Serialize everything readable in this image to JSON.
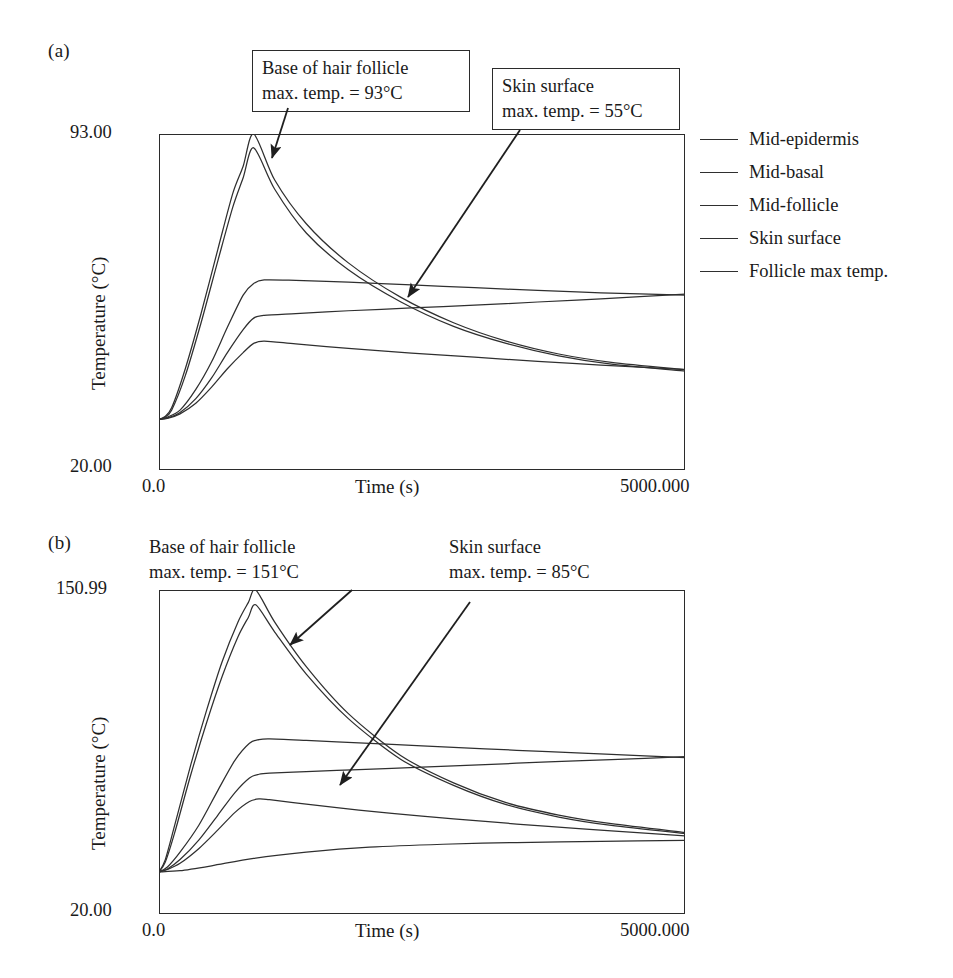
{
  "figure": {
    "panels": [
      {
        "id": "a",
        "label": "(a)",
        "callouts": [
          {
            "name": "follicle",
            "text": "Base of hair follicle\nmax. temp. = 93°C",
            "boxed": true
          },
          {
            "name": "skin",
            "text": "Skin surface\nmax. temp. = 55°C",
            "boxed": true
          }
        ],
        "axes": {
          "y_top_label": "93.00",
          "y_bottom_label": "20.00",
          "x_left_label": "0.0",
          "x_right_label": "5000.000",
          "x_title": "Time (s)",
          "y_title": "Temperature (°C)"
        },
        "legend": [
          {
            "label": "Mid-epidermis",
            "color": "#2f2f2f"
          },
          {
            "label": "Mid-basal",
            "color": "#2f2f2f"
          },
          {
            "label": "Mid-follicle",
            "color": "#2f2f2f"
          },
          {
            "label": "Skin surface",
            "color": "#2f2f2f"
          },
          {
            "label": "Follicle max temp.",
            "color": "#2f2f2f"
          }
        ]
      },
      {
        "id": "b",
        "label": "(b)",
        "callouts": [
          {
            "name": "follicle",
            "text": "Base of hair follicle\nmax. temp. = 151°C",
            "boxed": false
          },
          {
            "name": "skin",
            "text": "Skin surface\nmax. temp. = 85°C",
            "boxed": false
          }
        ],
        "axes": {
          "y_top_label": "150.99",
          "y_bottom_label": "20.00",
          "x_left_label": "0.0",
          "x_right_label": "5000.000",
          "x_title": "Time (s)",
          "y_title": "Temperature (°C)"
        },
        "legend": [
          {
            "label": "Mid-epidermis",
            "color": "#2f2f2f"
          },
          {
            "label": "Mid-basal",
            "color": "#2f2f2f"
          },
          {
            "label": "Mid-follicle",
            "color": "#2f2f2f"
          },
          {
            "label": "Skin surface",
            "color": "#2f2f2f"
          },
          {
            "label": "Follicle max temp.",
            "color": "#2f2f2f"
          }
        ]
      }
    ]
  },
  "chart_data": [
    {
      "panel": "a",
      "type": "line",
      "title": "(a)",
      "xlabel": "Time (s)",
      "ylabel": "Temperature (°C)",
      "xlim": [
        0.0,
        5000.0
      ],
      "ylim": [
        20.0,
        93.0
      ],
      "xticks": [
        0.0,
        5000.0
      ],
      "xticklabels": [
        "0.0",
        "5000.000"
      ],
      "yticks": [
        20.0,
        93.0
      ],
      "yticklabels": [
        "20.00",
        "93.00"
      ],
      "grid": false,
      "legend_position": "right",
      "annotations": [
        {
          "text": "Base of hair follicle max. temp. = 93°C",
          "points_to_series": "Follicle max temp."
        },
        {
          "text": "Skin surface max. temp. = 55°C",
          "points_to_series": "Skin surface"
        }
      ],
      "series": [
        {
          "name": "Follicle max temp.",
          "x": [
            0,
            50,
            120,
            250,
            400,
            560,
            700,
            800,
            900,
            1100,
            1400,
            1800,
            2300,
            2800,
            3300,
            3800,
            4300,
            5000
          ],
          "values": [
            31.0,
            31.5,
            33.5,
            42.0,
            54.0,
            68.0,
            80.0,
            86.0,
            93.0,
            83.0,
            73.5,
            65.0,
            57.5,
            52.0,
            48.0,
            45.2,
            43.4,
            41.8
          ]
        },
        {
          "name": "Mid-follicle",
          "x": [
            0,
            50,
            120,
            250,
            400,
            560,
            700,
            800,
            900,
            1100,
            1400,
            1800,
            2300,
            2800,
            3300,
            3800,
            4300,
            5000
          ],
          "values": [
            31.0,
            31.4,
            33.0,
            40.5,
            52.0,
            65.5,
            77.0,
            83.5,
            90.0,
            81.0,
            71.5,
            63.5,
            56.5,
            51.2,
            47.5,
            44.8,
            43.0,
            41.5
          ]
        },
        {
          "name": "Mid-epidermis",
          "x": [
            0,
            80,
            200,
            350,
            500,
            650,
            800,
            900,
            1000,
            1300,
            1800,
            2400,
            3000,
            3600,
            4200,
            5000
          ],
          "values": [
            31.0,
            31.5,
            33.0,
            37.5,
            43.5,
            51.0,
            58.0,
            60.5,
            61.3,
            61.2,
            60.8,
            60.2,
            59.6,
            59.0,
            58.5,
            58.0
          ]
        },
        {
          "name": "Mid-basal",
          "x": [
            0,
            80,
            200,
            350,
            500,
            650,
            800,
            900,
            1000,
            1300,
            1800,
            2400,
            3000,
            3600,
            4200,
            5000
          ],
          "values": [
            31.0,
            31.3,
            32.5,
            35.5,
            40.0,
            45.5,
            50.5,
            53.0,
            53.6,
            54.0,
            54.6,
            55.2,
            55.8,
            56.5,
            57.2,
            58.2
          ]
        },
        {
          "name": "Skin surface",
          "x": [
            0,
            80,
            200,
            350,
            500,
            650,
            800,
            900,
            1000,
            1300,
            1800,
            2400,
            3000,
            3600,
            4200,
            5000
          ],
          "values": [
            31.0,
            31.2,
            32.2,
            34.5,
            38.0,
            42.0,
            45.5,
            47.5,
            48.0,
            47.4,
            46.4,
            45.4,
            44.5,
            43.6,
            42.8,
            41.8
          ]
        }
      ]
    },
    {
      "panel": "b",
      "type": "line",
      "title": "(b)",
      "xlabel": "Time (s)",
      "ylabel": "Temperature (°C)",
      "xlim": [
        0.0,
        5000.0
      ],
      "ylim": [
        20.0,
        150.99
      ],
      "xticks": [
        0.0,
        5000.0
      ],
      "xticklabels": [
        "0.0",
        "5000.000"
      ],
      "yticks": [
        20.0,
        150.99
      ],
      "yticklabels": [
        "20.00",
        "150.99"
      ],
      "grid": false,
      "legend_position": "right",
      "annotations": [
        {
          "text": "Base of hair follicle max. temp. = 151°C",
          "points_to_series": "Follicle max temp."
        },
        {
          "text": "Skin surface max. temp. = 85°C",
          "points_to_series": "Skin surface"
        }
      ],
      "series": [
        {
          "name": "Follicle max temp.",
          "x": [
            0,
            60,
            150,
            300,
            450,
            600,
            750,
            850,
            920,
            1100,
            1400,
            1800,
            2300,
            2800,
            3300,
            3800,
            4300,
            5000
          ],
          "values": [
            37.0,
            42.0,
            56.0,
            80.0,
            102.0,
            122.0,
            138.0,
            146.0,
            151.0,
            138.0,
            120.0,
            101.0,
            84.0,
            73.0,
            65.0,
            60.0,
            56.5,
            53.0
          ]
        },
        {
          "name": "Mid-follicle",
          "x": [
            0,
            60,
            150,
            300,
            450,
            600,
            750,
            850,
            920,
            1100,
            1400,
            1800,
            2300,
            2800,
            3300,
            3800,
            4300,
            5000
          ],
          "values": [
            37.0,
            41.0,
            53.0,
            76.0,
            97.0,
            116.0,
            132.0,
            140.0,
            145.0,
            134.0,
            117.0,
            99.0,
            82.5,
            72.0,
            64.2,
            59.2,
            55.8,
            52.5
          ]
        },
        {
          "name": "Mid-epidermis",
          "x": [
            0,
            80,
            200,
            380,
            560,
            720,
            860,
            950,
            1050,
            1400,
            1900,
            2500,
            3100,
            3700,
            4300,
            5000
          ],
          "values": [
            37.0,
            39.0,
            45.0,
            56.0,
            70.0,
            82.0,
            89.0,
            90.5,
            90.8,
            90.2,
            89.2,
            88.0,
            86.8,
            85.6,
            84.5,
            83.2
          ]
        },
        {
          "name": "Mid-basal",
          "x": [
            0,
            80,
            200,
            380,
            560,
            720,
            860,
            950,
            1050,
            1400,
            1900,
            2500,
            3100,
            3700,
            4300,
            5000
          ],
          "values": [
            37.0,
            38.2,
            42.0,
            50.0,
            60.0,
            69.0,
            75.0,
            76.5,
            77.0,
            77.6,
            78.4,
            79.4,
            80.4,
            81.5,
            82.4,
            83.6
          ]
        },
        {
          "name": "Skin surface",
          "x": [
            0,
            80,
            200,
            380,
            560,
            720,
            860,
            950,
            1050,
            1400,
            1900,
            2500,
            3100,
            3700,
            4300,
            5000
          ],
          "values": [
            37.0,
            38.0,
            40.5,
            46.5,
            54.0,
            61.0,
            65.5,
            66.5,
            66.2,
            64.4,
            62.0,
            59.6,
            57.4,
            55.4,
            53.6,
            51.6
          ]
        },
        {
          "name": "Baseline",
          "x": [
            0,
            200,
            500,
            900,
            1400,
            2000,
            2700,
            3400,
            4200,
            5000
          ],
          "values": [
            37.0,
            37.5,
            39.5,
            42.5,
            45.0,
            47.0,
            48.2,
            48.9,
            49.4,
            49.8
          ]
        }
      ]
    }
  ]
}
